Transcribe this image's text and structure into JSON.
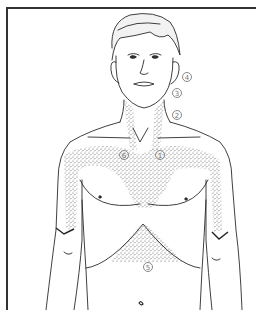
{
  "figure": {
    "stipple_color": "#6a6a6a",
    "line_color": "#2a2a2a",
    "labels": [
      {
        "id": "1",
        "text": "1",
        "x": 155,
        "y": 150
      },
      {
        "id": "2",
        "text": "2",
        "x": 172,
        "y": 110
      },
      {
        "id": "3",
        "text": "3",
        "x": 172,
        "y": 88
      },
      {
        "id": "4",
        "text": "4",
        "x": 182,
        "y": 72
      },
      {
        "id": "5",
        "text": "5",
        "x": 143,
        "y": 262
      },
      {
        "id": "6",
        "text": "6",
        "x": 119,
        "y": 150
      }
    ]
  }
}
